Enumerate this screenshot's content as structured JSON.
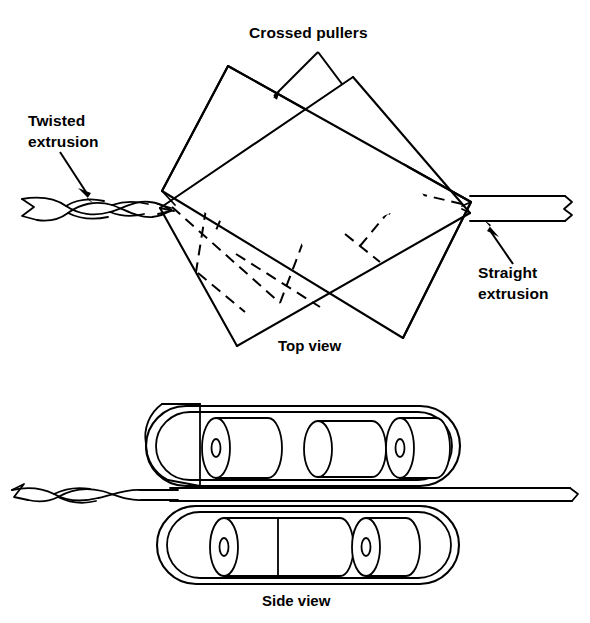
{
  "figure": {
    "background_color": "#ffffff",
    "line_color": "#000000",
    "width": 590,
    "height": 623
  },
  "labels": {
    "crossed_pullers": "Crossed pullers",
    "twisted_extrusion_line1": "Twisted",
    "twisted_extrusion_line2": "extrusion",
    "straight_extrusion_line1": "Straight",
    "straight_extrusion_line2": "extrusion",
    "top_view": "Top view",
    "side_view": "Side view"
  },
  "top_view": {
    "caption": "Top view",
    "puller_upper_left": {
      "name": "upper-left-puller-belt",
      "points": "228,67 305,188 163,245 157,188"
    },
    "puller_upper_right": {
      "name": "upper-right-puller-belt",
      "points": "352,78 470,200 300,188 238,118"
    },
    "belt_a_outline": "228,67 471,202 403,338 162,191",
    "belt_b_outline": "353,77 160,208 237,346 470,213",
    "hidden_edges": [
      "262,122 215,236",
      "218,228 196,273",
      "196,273 276,302",
      "276,302 315,209",
      "330,136 392,221",
      "392,221 414,186",
      "414,186 340,230",
      "287,168 330,136",
      "240,258 318,306",
      "360,246 400,198"
    ],
    "arrows": {
      "apex": "318,52",
      "left_target": "268,92",
      "right_target": "352,100"
    }
  },
  "side_view": {
    "caption": "Side view",
    "upper_belt": {
      "name": "upper-belt-assembly",
      "x": 145,
      "y": 405,
      "width": 310,
      "height": 80,
      "roller_count": 3
    },
    "lower_belt": {
      "name": "lower-belt-assembly",
      "x": 155,
      "y": 505,
      "width": 300,
      "height": 78,
      "roller_count": 2
    },
    "extrusion_strip": {
      "name": "extrusion-strip",
      "left_x": 85,
      "right_x": 578,
      "top_y": 487,
      "bottom_y": 500
    },
    "roller_axle_marker": "0"
  },
  "extrusions": {
    "twisted": {
      "name": "twisted-extrusion-strand",
      "description": "helically twisted flat strip entering from the left",
      "start_x": 18,
      "end_x": 170,
      "center_y": 208
    },
    "straight": {
      "name": "straight-extrusion-bar",
      "description": "flat untwisted bar exiting to the right with break symbol",
      "start_x": 472,
      "end_x": 578,
      "top_y": 196,
      "bottom_y": 221
    }
  },
  "colors": {
    "ink": "#000000",
    "paper": "#ffffff"
  }
}
